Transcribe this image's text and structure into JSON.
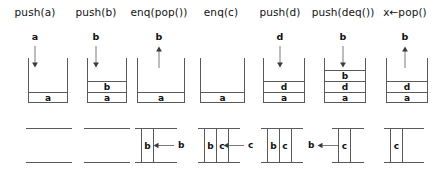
{
  "figure": {
    "colors": {
      "stroke": "#595959",
      "text": "#111111",
      "background": "#ffffff"
    },
    "steps": [
      {
        "id": "step-1",
        "operation": "push(a)",
        "x": 4,
        "width": 62,
        "incoming": "a",
        "arrow": "down",
        "stack": [
          "a"
        ],
        "stack_x": 24,
        "stack_width": 40,
        "queue": [],
        "queue_x": 22,
        "queue_width": 46,
        "flow": null
      },
      {
        "id": "step-2",
        "operation": "push(b)",
        "x": 66,
        "width": 60,
        "incoming": "b",
        "arrow": "down",
        "stack": [
          "b",
          "a"
        ],
        "stack_x": 21,
        "stack_width": 40,
        "queue": [],
        "queue_x": 18,
        "queue_width": 46,
        "flow": null
      },
      {
        "id": "step-3",
        "operation": "enq(pop())",
        "x": 126,
        "width": 66,
        "incoming": "b",
        "arrow": "up",
        "stack": [
          "a"
        ],
        "stack_x": 11,
        "stack_width": 48,
        "queue": [
          "b"
        ],
        "queue_x": 9,
        "queue_width": 42,
        "flow": {
          "token": "b",
          "direction": "left",
          "x": 27,
          "gap": 4
        }
      },
      {
        "id": "step-4",
        "operation": "enq(c)",
        "x": 192,
        "width": 58,
        "incoming": null,
        "arrow": null,
        "stack": [
          "a"
        ],
        "stack_x": 8,
        "stack_width": 45,
        "queue": [
          "b",
          "c"
        ],
        "queue_x": 6,
        "queue_width": 42,
        "flow": {
          "token": "c",
          "direction": "left",
          "x": 31,
          "gap": 4
        }
      },
      {
        "id": "step-5",
        "operation": "push(d)",
        "x": 250,
        "width": 60,
        "incoming": "d",
        "arrow": "down",
        "stack": [
          "d",
          "a"
        ],
        "stack_x": 13,
        "stack_width": 42,
        "queue": [
          "b",
          "c"
        ],
        "queue_x": 11,
        "queue_width": 42,
        "flow": null
      },
      {
        "id": "step-6",
        "operation": "push(deq())",
        "x": 310,
        "width": 66,
        "incoming": "b",
        "arrow": "down",
        "stack": [
          "b",
          "d",
          "a"
        ],
        "stack_x": 14,
        "stack_width": 42,
        "queue": [
          "c"
        ],
        "queue_x": 22,
        "queue_width": 32,
        "flow": {
          "token": "b",
          "direction": "left",
          "x": -2,
          "gap": 3
        }
      },
      {
        "id": "step-7",
        "operation": "x←pop()",
        "x": 376,
        "width": 58,
        "incoming": "b",
        "arrow": "up",
        "stack": [
          "d",
          "a"
        ],
        "stack_x": 10,
        "stack_width": 42,
        "queue": [
          "c"
        ],
        "queue_x": 8,
        "queue_width": 40,
        "flow": null
      }
    ]
  }
}
